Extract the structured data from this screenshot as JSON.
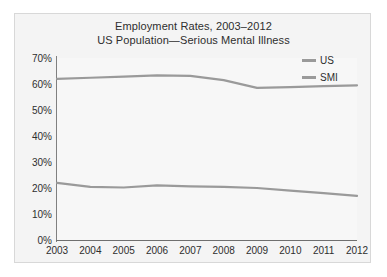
{
  "chart_data": {
    "type": "line",
    "title": "Employment Rates, 2003–2012",
    "subtitle": "US Population—Serious Mental Illness",
    "xlabel": "",
    "ylabel": "",
    "categories": [
      "2003",
      "2004",
      "2005",
      "2006",
      "2007",
      "2008",
      "2009",
      "2010",
      "2011",
      "2012"
    ],
    "x": [
      2003,
      2004,
      2005,
      2006,
      2007,
      2008,
      2009,
      2010,
      2011,
      2012
    ],
    "series": [
      {
        "name": "US",
        "color": "#9a9a9a",
        "values": [
          62.0,
          62.4,
          62.8,
          63.3,
          63.1,
          61.5,
          58.5,
          58.8,
          59.2,
          59.5
        ]
      },
      {
        "name": "SMI",
        "color": "#9a9a9a",
        "values": [
          22.0,
          20.4,
          20.2,
          21.0,
          20.6,
          20.4,
          20.0,
          19.0,
          18.0,
          17.0
        ]
      }
    ],
    "ylim": [
      0,
      70
    ],
    "ytick_values": [
      0,
      10,
      20,
      30,
      40,
      50,
      60,
      70
    ],
    "ytick_labels": [
      "0%",
      "10%",
      "20%",
      "30%",
      "40%",
      "50%",
      "60%",
      "70%"
    ],
    "xlim": [
      2003,
      2012
    ],
    "grid": false,
    "legend_position": "top-right",
    "legend_entries": [
      "US",
      "SMI"
    ],
    "background_color": "#f4f4f4",
    "axis_color": "#6f6f6f",
    "text_color": "#2e2e2e"
  }
}
